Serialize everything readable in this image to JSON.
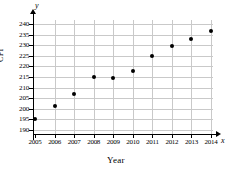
{
  "chart_data": {
    "type": "scatter",
    "title": "",
    "xlabel": "Year",
    "ylabel": "CPI",
    "x_axis_name": "x",
    "y_axis_name": "y",
    "grid": true,
    "legend": "none",
    "xlim": [
      2005,
      2014
    ],
    "ylim": [
      190,
      240
    ],
    "ytick_step": 5,
    "categories": [
      2005,
      2006,
      2007,
      2008,
      2009,
      2010,
      2011,
      2012,
      2013,
      2014
    ],
    "xtick_labels": [
      "2005",
      "2006",
      "2007",
      "2008",
      "2009",
      "2010",
      "2011",
      "2012",
      "2013",
      "2014"
    ],
    "ytick_labels": [
      "190",
      "195",
      "200",
      "205",
      "210",
      "215",
      "220",
      "225",
      "230",
      "235",
      "240"
    ],
    "ytick_values": [
      190,
      195,
      200,
      205,
      210,
      215,
      220,
      225,
      230,
      235,
      240
    ],
    "values": [
      195.0,
      201.5,
      207.2,
      215.2,
      214.5,
      218.0,
      225.0,
      229.5,
      233.0,
      236.5
    ],
    "points": [
      {
        "x": 2005,
        "y": 195.0
      },
      {
        "x": 2006,
        "y": 201.5
      },
      {
        "x": 2007,
        "y": 207.2
      },
      {
        "x": 2008,
        "y": 215.2
      },
      {
        "x": 2009,
        "y": 214.5
      },
      {
        "x": 2010,
        "y": 218.0
      },
      {
        "x": 2011,
        "y": 225.0
      },
      {
        "x": 2012,
        "y": 229.5
      },
      {
        "x": 2013,
        "y": 233.0
      },
      {
        "x": 2014,
        "y": 236.5
      }
    ],
    "colors": {
      "marker": "#000000",
      "axis": "#000000",
      "grid": "#c9c9c9",
      "background": "#ffffff"
    }
  }
}
